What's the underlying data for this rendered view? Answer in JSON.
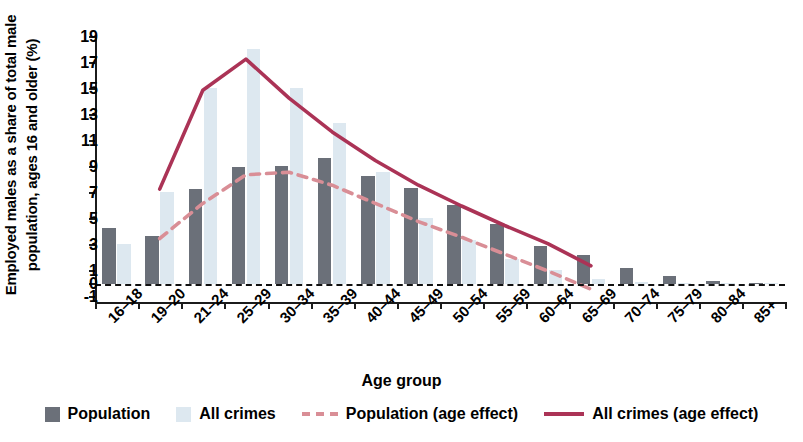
{
  "axes": {
    "ylabel_line1": "Employed males as a share of total male",
    "ylabel_line2": "population, ages 16 and older (%)",
    "xlabel": "Age group"
  },
  "legend": {
    "items": [
      {
        "label": "Population",
        "marker": "bar-swatch",
        "color": "#6b7079"
      },
      {
        "label": "All crimes",
        "marker": "bar-swatch",
        "color": "#dde8f0"
      },
      {
        "label": "Population (age effect)",
        "marker": "dashed-line",
        "color": "#d98e96"
      },
      {
        "label": "All crimes (age effect)",
        "marker": "solid-line",
        "color": "#ab3356"
      }
    ]
  },
  "chart_data": {
    "type": "bar",
    "title": "",
    "xlabel": "Age group",
    "ylabel": "Employed males as a share of total male population, ages 16 and older (%)",
    "ylim": [
      -1,
      19
    ],
    "yticks": [
      -1,
      0,
      1,
      3,
      5,
      7,
      9,
      11,
      13,
      15,
      17,
      19
    ],
    "ytick_labels": [
      "-1",
      "0",
      "1",
      "3",
      "5",
      "7",
      "9",
      "11",
      "13",
      "15",
      "17",
      "19"
    ],
    "grid": false,
    "legend_position": "bottom",
    "categories": [
      "16–18",
      "19–20",
      "21–24",
      "25–29",
      "30–34",
      "35–39",
      "40–44",
      "45–49",
      "50–54",
      "55–59",
      "60–64",
      "65–69",
      "70–74",
      "75–79",
      "80–84",
      "85+"
    ],
    "series": [
      {
        "name": "Population",
        "kind": "bar",
        "color": "#6b7079",
        "values": [
          4.3,
          3.7,
          7.3,
          9.0,
          9.1,
          9.7,
          8.3,
          7.4,
          6.1,
          4.6,
          2.9,
          2.2,
          1.2,
          0.6,
          0.2,
          0.1
        ]
      },
      {
        "name": "All crimes",
        "kind": "bar",
        "color": "#dde8f0",
        "values": [
          3.1,
          7.1,
          15.1,
          18.1,
          15.1,
          12.4,
          8.6,
          5.1,
          3.4,
          1.9,
          1.1,
          0.4,
          0.15,
          0.1,
          0.05,
          0.05
        ]
      },
      {
        "name": "Population (age effect)",
        "kind": "line",
        "style": "dashed",
        "color": "#d98e96",
        "x": [
          "19–20",
          "21–24",
          "25–29",
          "30–34",
          "35–39",
          "40–44",
          "45–49",
          "50–54",
          "55–59",
          "60–64",
          "65–69"
        ],
        "values": [
          3.5,
          6.2,
          8.4,
          8.6,
          7.6,
          6.2,
          4.8,
          3.6,
          2.3,
          1.0,
          -0.4
        ]
      },
      {
        "name": "All crimes (age effect)",
        "kind": "line",
        "style": "solid",
        "color": "#ab3356",
        "x": [
          "19–20",
          "21–24",
          "25–29",
          "30–34",
          "35–39",
          "40–44",
          "45–49",
          "50–54",
          "55–59",
          "60–64",
          "65–69"
        ],
        "values": [
          7.3,
          14.9,
          17.3,
          14.3,
          11.7,
          9.5,
          7.6,
          6.0,
          4.5,
          3.1,
          1.4
        ]
      }
    ]
  }
}
